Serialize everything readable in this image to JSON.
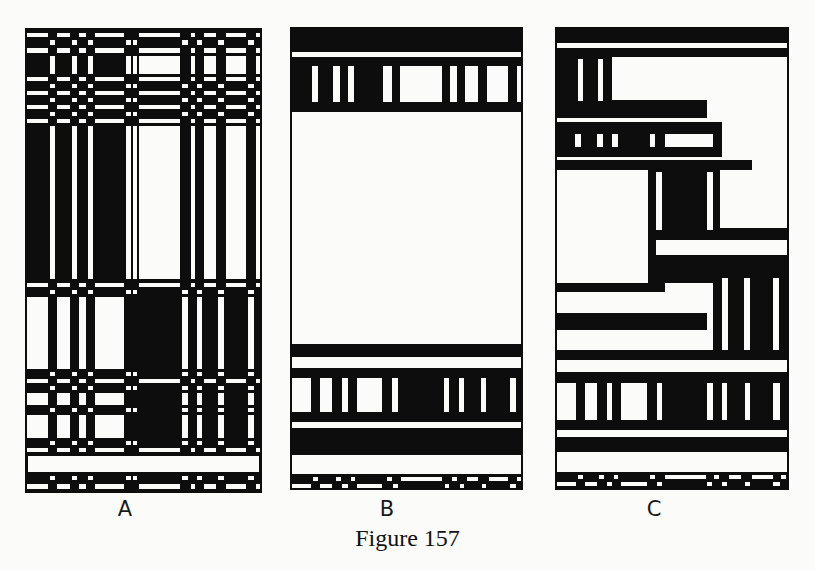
{
  "figure": {
    "caption": "Figure 157",
    "ink": "#0d0d0d",
    "paper": "#fbfbf9"
  },
  "panels": [
    {
      "id": "A",
      "label": "A",
      "box": [
        25,
        28,
        262,
        493
      ],
      "label_pos": [
        125,
        497
      ],
      "mode": "plaid",
      "columns": {
        "a": [
          [
            27,
            48
          ],
          [
            57,
            70
          ],
          [
            79,
            86
          ],
          [
            95,
            124
          ]
        ],
        "b": [
          [
            50,
            55
          ],
          [
            72,
            77
          ],
          [
            88,
            93
          ],
          [
            126,
            131
          ],
          [
            133,
            137
          ]
        ],
        "c": [
          [
            139,
            180
          ],
          [
            191,
            195
          ],
          [
            204,
            216
          ],
          [
            226,
            246
          ],
          [
            256,
            260
          ]
        ],
        "d": [
          [
            182,
            188
          ],
          [
            197,
            202
          ],
          [
            218,
            224
          ],
          [
            248,
            254
          ]
        ]
      },
      "rows": [
        {
          "y": [
            33,
            37
          ],
          "white": [
            "a",
            "c"
          ]
        },
        {
          "y": [
            40,
            45
          ],
          "white": [
            "b",
            "d"
          ]
        },
        {
          "y": [
            48,
            53
          ],
          "white": [
            "a",
            "c"
          ]
        },
        {
          "y": [
            56,
            74
          ],
          "white": [
            "b",
            "c"
          ]
        },
        {
          "y": [
            77,
            81
          ],
          "white": [
            "a",
            "c"
          ]
        },
        {
          "y": [
            84,
            88
          ],
          "white": [
            "b",
            "d"
          ]
        },
        {
          "y": [
            91,
            95
          ],
          "white": [
            "a",
            "c"
          ]
        },
        {
          "y": [
            98,
            102
          ],
          "white": [
            "b",
            "d"
          ]
        },
        {
          "y": [
            105,
            109
          ],
          "white": [
            "a",
            "c"
          ]
        },
        {
          "y": [
            112,
            116
          ],
          "white": [
            "b",
            "d"
          ]
        },
        {
          "y": [
            119,
            123
          ],
          "white": [
            "a",
            "c"
          ]
        },
        {
          "y": [
            126,
            279
          ],
          "white": [
            "b",
            "c"
          ]
        },
        {
          "y": [
            283,
            287
          ],
          "white": [
            "a",
            "c"
          ]
        },
        {
          "y": [
            290,
            294
          ],
          "white": [
            "b",
            "d"
          ]
        },
        {
          "y": [
            297,
            369
          ],
          "white": [
            "a",
            "d"
          ]
        },
        {
          "y": [
            372,
            376
          ],
          "white": [
            "b",
            "d"
          ]
        },
        {
          "y": [
            379,
            383
          ],
          "white": [
            "a",
            "c"
          ]
        },
        {
          "y": [
            386,
            390
          ],
          "white": [
            "b",
            "d"
          ]
        },
        {
          "y": [
            393,
            405
          ],
          "white": [
            "a",
            "d"
          ]
        },
        {
          "y": [
            408,
            412
          ],
          "white": [
            "b",
            "d"
          ]
        },
        {
          "y": [
            415,
            438
          ],
          "white": [
            "a",
            "d"
          ]
        },
        {
          "y": [
            441,
            445
          ],
          "white": [
            "b",
            "d"
          ]
        },
        {
          "y": [
            448,
            452
          ],
          "white": [
            "a",
            "c"
          ]
        },
        {
          "y": [
            456,
            472
          ],
          "white": [
            "full"
          ]
        },
        {
          "y": [
            476,
            480
          ],
          "white": [
            "b",
            "d"
          ]
        },
        {
          "y": [
            484,
            489
          ],
          "white": [
            "a",
            "c"
          ]
        }
      ]
    },
    {
      "id": "B",
      "label": "B",
      "box": [
        290,
        27,
        523,
        490
      ],
      "label_pos": [
        387,
        497
      ],
      "mode": "rects",
      "background": "ink",
      "rects": [
        [
          292,
          52,
          521,
          57
        ],
        [
          312,
          66,
          318,
          102
        ],
        [
          333,
          66,
          340,
          102
        ],
        [
          348,
          66,
          354,
          102
        ],
        [
          383,
          66,
          392,
          102
        ],
        [
          400,
          66,
          442,
          102
        ],
        [
          450,
          66,
          457,
          102
        ],
        [
          465,
          66,
          478,
          102
        ],
        [
          487,
          66,
          508,
          102
        ],
        [
          517,
          66,
          521,
          102
        ],
        [
          292,
          112,
          521,
          344
        ],
        [
          292,
          357,
          521,
          368
        ],
        [
          292,
          378,
          311,
          412
        ],
        [
          320,
          378,
          332,
          412
        ],
        [
          342,
          378,
          348,
          412
        ],
        [
          357,
          378,
          382,
          412
        ],
        [
          392,
          378,
          398,
          412
        ],
        [
          444,
          378,
          449,
          412
        ],
        [
          459,
          378,
          464,
          412
        ],
        [
          481,
          378,
          486,
          412
        ],
        [
          510,
          378,
          516,
          412
        ],
        [
          292,
          422,
          521,
          428
        ],
        [
          292,
          455,
          521,
          474
        ],
        [
          313,
          477,
          318,
          481
        ],
        [
          336,
          477,
          341,
          481
        ],
        [
          351,
          477,
          355,
          481
        ],
        [
          387,
          477,
          392,
          481
        ],
        [
          401,
          477,
          442,
          481
        ],
        [
          452,
          477,
          457,
          481
        ],
        [
          467,
          477,
          478,
          481
        ],
        [
          489,
          477,
          508,
          481
        ],
        [
          517,
          477,
          521,
          481
        ],
        [
          292,
          484,
          311,
          488
        ],
        [
          320,
          484,
          332,
          488
        ],
        [
          342,
          484,
          348,
          488
        ],
        [
          357,
          484,
          382,
          488
        ],
        [
          393,
          484,
          398,
          488
        ],
        [
          445,
          484,
          449,
          488
        ],
        [
          460,
          484,
          464,
          488
        ],
        [
          482,
          484,
          486,
          488
        ],
        [
          510,
          484,
          516,
          488
        ]
      ]
    },
    {
      "id": "C",
      "label": "C",
      "box": [
        555,
        27,
        789,
        490
      ],
      "label_pos": [
        654,
        497
      ],
      "mode": "rects",
      "background": "ink",
      "rects": [
        [
          557,
          43,
          787,
          48
        ],
        [
          612,
          57,
          787,
          100
        ],
        [
          578,
          59,
          583,
          101
        ],
        [
          598,
          59,
          603,
          101
        ],
        [
          707,
          100,
          787,
          118
        ],
        [
          557,
          118,
          722,
          122
        ],
        [
          722,
          118,
          787,
          160
        ],
        [
          575,
          134,
          581,
          147
        ],
        [
          597,
          134,
          603,
          147
        ],
        [
          612,
          134,
          618,
          147
        ],
        [
          650,
          134,
          655,
          147
        ],
        [
          665,
          134,
          713,
          147
        ],
        [
          557,
          157,
          722,
          160
        ],
        [
          752,
          160,
          787,
          170
        ],
        [
          557,
          170,
          648,
          283
        ],
        [
          656,
          172,
          662,
          230
        ],
        [
          707,
          172,
          713,
          230
        ],
        [
          720,
          170,
          787,
          228
        ],
        [
          656,
          240,
          787,
          255
        ],
        [
          557,
          283,
          648,
          283
        ],
        [
          665,
          283,
          713,
          292
        ],
        [
          557,
          292,
          713,
          313
        ],
        [
          707,
          313,
          713,
          330
        ],
        [
          557,
          330,
          713,
          350
        ],
        [
          722,
          278,
          728,
          350
        ],
        [
          744,
          278,
          750,
          350
        ],
        [
          773,
          278,
          779,
          350
        ],
        [
          557,
          360,
          787,
          372
        ],
        [
          557,
          383,
          576,
          420
        ],
        [
          585,
          383,
          597,
          420
        ],
        [
          607,
          383,
          612,
          420
        ],
        [
          621,
          383,
          647,
          420
        ],
        [
          657,
          383,
          662,
          420
        ],
        [
          707,
          383,
          713,
          420
        ],
        [
          722,
          383,
          727,
          420
        ],
        [
          745,
          383,
          750,
          420
        ],
        [
          773,
          383,
          780,
          420
        ],
        [
          557,
          430,
          787,
          437
        ],
        [
          557,
          452,
          787,
          472
        ],
        [
          578,
          475,
          583,
          479
        ],
        [
          599,
          475,
          604,
          479
        ],
        [
          614,
          475,
          618,
          479
        ],
        [
          650,
          475,
          655,
          479
        ],
        [
          665,
          475,
          706,
          479
        ],
        [
          714,
          475,
          719,
          479
        ],
        [
          729,
          475,
          741,
          479
        ],
        [
          752,
          475,
          773,
          479
        ],
        [
          781,
          475,
          786,
          479
        ],
        [
          557,
          482,
          576,
          486
        ],
        [
          585,
          482,
          597,
          486
        ],
        [
          607,
          482,
          612,
          486
        ],
        [
          621,
          482,
          647,
          486
        ],
        [
          657,
          482,
          662,
          486
        ],
        [
          707,
          482,
          712,
          486
        ],
        [
          722,
          482,
          727,
          486
        ],
        [
          745,
          482,
          750,
          486
        ],
        [
          773,
          482,
          780,
          486
        ]
      ]
    }
  ]
}
